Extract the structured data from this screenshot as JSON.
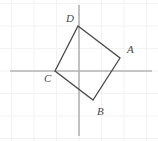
{
  "figure": {
    "type": "geometry-diagram",
    "canvas": {
      "width": 158,
      "height": 141
    },
    "background_color": "#ffffff"
  },
  "grid": {
    "visible": true,
    "color": "#f2f2f2",
    "spacing_px": 22.5,
    "x_lines": [
      11.5,
      34,
      56.5,
      79,
      101.5,
      124,
      146.5
    ],
    "y_lines": [
      3.5,
      26,
      48.5,
      71,
      93.5,
      116,
      138.5
    ]
  },
  "axes": {
    "color": "#b3b3b3",
    "stroke_width": 1.6,
    "x_axis": {
      "name": "horizontal-axis",
      "y": 71,
      "x1": 10,
      "x2": 152
    },
    "y_axis": {
      "name": "vertical-axis",
      "x": 79,
      "y1": 5,
      "y2": 136
    },
    "origin": {
      "x": 79,
      "y": 71
    }
  },
  "shape": {
    "name": "square-abcd",
    "stroke_color": "#4a4a4a",
    "stroke_width": 1.3,
    "fill": "none",
    "vertices": [
      {
        "id": "A",
        "label": "A",
        "x": 120,
        "y": 58,
        "label_x": 127,
        "label_y": 53
      },
      {
        "id": "B",
        "label": "B",
        "x": 93,
        "y": 100,
        "label_x": 97,
        "label_y": 115
      },
      {
        "id": "C",
        "label": "C",
        "x": 55,
        "y": 71,
        "label_x": 44,
        "label_y": 82
      },
      {
        "id": "D",
        "label": "D",
        "x": 78,
        "y": 26,
        "label_x": 66,
        "label_y": 22
      }
    ],
    "edges": [
      {
        "from": "D",
        "to": "A"
      },
      {
        "from": "A",
        "to": "B"
      },
      {
        "from": "B",
        "to": "C"
      },
      {
        "from": "C",
        "to": "D"
      }
    ],
    "path": "M 78 26 L 120 58 L 93 100 L 55 71 Z"
  },
  "labels": {
    "A": "A",
    "B": "B",
    "C": "C",
    "D": "D"
  }
}
